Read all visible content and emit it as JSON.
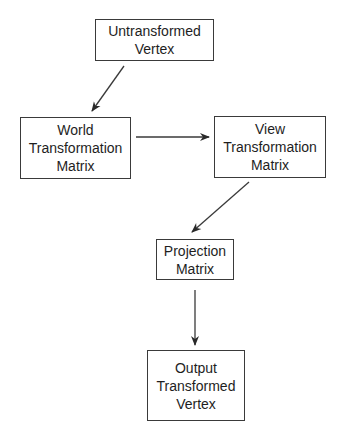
{
  "diagram": {
    "type": "flowchart",
    "nodes": [
      {
        "id": "untransformed",
        "lines": [
          "Untransformed",
          "Vertex"
        ]
      },
      {
        "id": "world",
        "lines": [
          "World",
          "Transformation",
          "Matrix"
        ]
      },
      {
        "id": "view",
        "lines": [
          "View",
          "Transformation",
          "Matrix"
        ]
      },
      {
        "id": "projection",
        "lines": [
          "Projection",
          "Matrix"
        ]
      },
      {
        "id": "output",
        "lines": [
          "Output",
          "Transformed",
          "Vertex"
        ]
      }
    ],
    "edges": [
      {
        "from": "untransformed",
        "to": "world"
      },
      {
        "from": "world",
        "to": "view"
      },
      {
        "from": "view",
        "to": "projection"
      },
      {
        "from": "projection",
        "to": "output"
      }
    ],
    "colors": {
      "line": "#3a3a3a",
      "text": "#1e1e1e",
      "background": "#ffffff"
    }
  }
}
